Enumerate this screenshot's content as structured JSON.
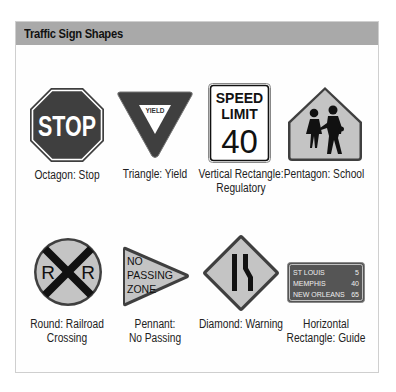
{
  "header": {
    "title": "Traffic Sign Shapes"
  },
  "colors": {
    "header_bg": "#a9a9a9",
    "sign_dark": "#3f3f3f",
    "sign_light": "#c4c4c4",
    "guide_bg": "#555555"
  },
  "signs": [
    {
      "shape": "octagon",
      "legend": "STOP",
      "caption": [
        "Octagon: Stop"
      ]
    },
    {
      "shape": "triangle",
      "legend": "YIELD",
      "caption": [
        "Triangle: Yield"
      ]
    },
    {
      "shape": "vertical-rectangle",
      "legend": [
        "SPEED",
        "LIMIT",
        "40"
      ],
      "caption": [
        "Vertical Rectangle:",
        "Regulatory"
      ]
    },
    {
      "shape": "pentagon",
      "legend": "school-children-icon",
      "caption": [
        "Pentagon: School"
      ]
    },
    {
      "shape": "round",
      "legend": [
        "R",
        "R"
      ],
      "caption": [
        "Round: Railroad",
        "Crossing"
      ]
    },
    {
      "shape": "pennant",
      "legend": [
        "NO",
        "PASSING",
        "ZONE"
      ],
      "caption": [
        "Pennant:",
        "No Passing"
      ]
    },
    {
      "shape": "diamond",
      "legend": "lane-ends-icon",
      "caption": [
        "Diamond: Warning"
      ]
    },
    {
      "shape": "horizontal-rectangle",
      "legend": [
        [
          "ST LOUIS",
          "5"
        ],
        [
          "MEMPHIS",
          "40"
        ],
        [
          "NEW ORLEANS",
          "65"
        ]
      ],
      "caption": [
        "Horizontal",
        "Rectangle: Guide"
      ]
    }
  ]
}
